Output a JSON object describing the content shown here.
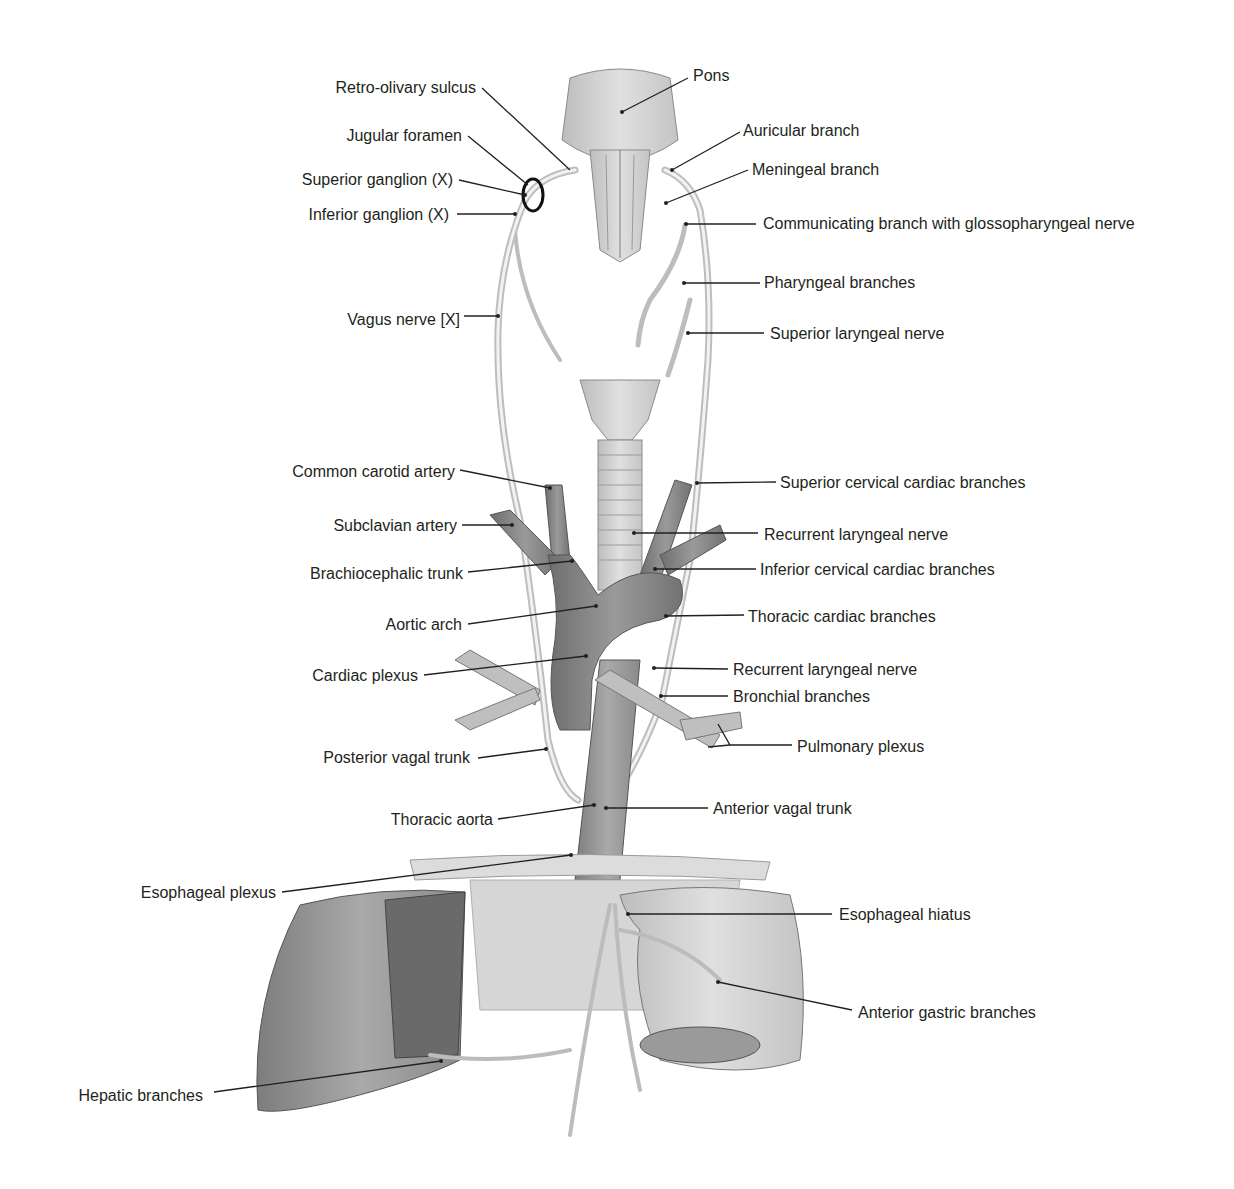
{
  "figure": {
    "colors": {
      "structure_fill": "#c9c9c9",
      "structure_dark": "#8c8c8c",
      "nerve": "#e6e6e6",
      "leader": "#231f20",
      "text": "#231f20"
    }
  },
  "labels_left": [
    {
      "id": "retro-olivary-sulcus",
      "text": "Retro-olivary sulcus"
    },
    {
      "id": "jugular-foramen",
      "text": "Jugular foramen"
    },
    {
      "id": "superior-ganglion",
      "text": "Superior ganglion (X)"
    },
    {
      "id": "inferior-ganglion",
      "text": "Inferior ganglion (X)"
    },
    {
      "id": "vagus-nerve",
      "text": "Vagus nerve [X]"
    },
    {
      "id": "common-carotid-artery",
      "text": "Common carotid artery"
    },
    {
      "id": "subclavian-artery",
      "text": "Subclavian artery"
    },
    {
      "id": "brachiocephalic-trunk",
      "text": "Brachiocephalic trunk"
    },
    {
      "id": "aortic-arch",
      "text": "Aortic arch"
    },
    {
      "id": "cardiac-plexus",
      "text": "Cardiac plexus"
    },
    {
      "id": "posterior-vagal-trunk",
      "text": "Posterior vagal trunk"
    },
    {
      "id": "thoracic-aorta",
      "text": "Thoracic aorta"
    },
    {
      "id": "esophageal-plexus",
      "text": "Esophageal plexus"
    },
    {
      "id": "hepatic-branches",
      "text": "Hepatic branches"
    }
  ],
  "labels_right": [
    {
      "id": "pons",
      "text": "Pons"
    },
    {
      "id": "auricular-branch",
      "text": "Auricular branch"
    },
    {
      "id": "meningeal-branch",
      "text": "Meningeal branch"
    },
    {
      "id": "communicating-branch",
      "text": "Communicating branch with glossopharyngeal nerve"
    },
    {
      "id": "pharyngeal-branches",
      "text": "Pharyngeal branches"
    },
    {
      "id": "superior-laryngeal-nerve",
      "text": "Superior laryngeal nerve"
    },
    {
      "id": "superior-cervical-cardiac-branches",
      "text": "Superior cervical cardiac branches"
    },
    {
      "id": "recurrent-laryngeal-nerve-upper",
      "text": "Recurrent laryngeal nerve"
    },
    {
      "id": "inferior-cervical-cardiac-branches",
      "text": "Inferior cervical cardiac branches"
    },
    {
      "id": "thoracic-cardiac-branches",
      "text": "Thoracic cardiac branches"
    },
    {
      "id": "recurrent-laryngeal-nerve-lower",
      "text": "Recurrent laryngeal nerve"
    },
    {
      "id": "bronchial-branches",
      "text": "Bronchial branches"
    },
    {
      "id": "pulmonary-plexus",
      "text": "Pulmonary plexus"
    },
    {
      "id": "anterior-vagal-trunk",
      "text": "Anterior vagal trunk"
    },
    {
      "id": "esophageal-hiatus",
      "text": "Esophageal hiatus"
    },
    {
      "id": "anterior-gastric-branches",
      "text": "Anterior gastric branches"
    }
  ]
}
